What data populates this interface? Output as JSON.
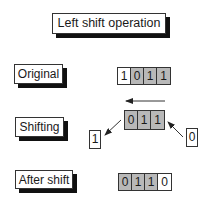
{
  "title": "Left shift operation",
  "rows": {
    "original": {
      "label": "Original",
      "bits": [
        {
          "value": "1",
          "shade": "white"
        },
        {
          "value": "0",
          "shade": "gray"
        },
        {
          "value": "1",
          "shade": "gray"
        },
        {
          "value": "1",
          "shade": "gray"
        }
      ]
    },
    "shifting": {
      "label": "Shifting",
      "bits": [
        {
          "value": "0",
          "shade": "gray"
        },
        {
          "value": "1",
          "shade": "gray"
        },
        {
          "value": "1",
          "shade": "gray"
        }
      ],
      "shifted_out_bit": "1",
      "shifted_in_bit": "0",
      "direction_arrow": "left-arrow-icon"
    },
    "after": {
      "label": "After shift",
      "bits": [
        {
          "value": "0",
          "shade": "gray"
        },
        {
          "value": "1",
          "shade": "gray"
        },
        {
          "value": "1",
          "shade": "gray"
        },
        {
          "value": "0",
          "shade": "white"
        }
      ]
    }
  },
  "colors": {
    "gray_cell": "#b8b8b8",
    "white_cell": "#ffffff",
    "shadow": "#111111",
    "stroke": "#333333"
  }
}
